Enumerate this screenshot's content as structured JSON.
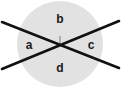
{
  "figure": {
    "background_color": "#ffffff",
    "circle": {
      "name": "shaded-circle",
      "fill_color": "#e2e2e2",
      "center_x": 60,
      "center_y": 44,
      "radius": 43
    },
    "lines": [
      {
        "name": "line-ascending",
        "color": "#111111",
        "width": 2.6,
        "x1": 2,
        "y1": 69,
        "x2": 119,
        "y2": 21
      },
      {
        "name": "line-descending",
        "color": "#111111",
        "width": 2.6,
        "x1": 2,
        "y1": 22,
        "x2": 119,
        "y2": 68
      }
    ],
    "tick_mark": {
      "name": "center-tick",
      "color": "#6e6e6e",
      "x1": 60,
      "y1": 36,
      "x2": 60,
      "y2": 43
    },
    "labels": [
      {
        "name": "angle-label-b",
        "text": "b",
        "x": 60,
        "y": 20
      },
      {
        "name": "angle-label-a",
        "text": "a",
        "x": 29,
        "y": 46
      },
      {
        "name": "angle-label-c",
        "text": "c",
        "x": 91,
        "y": 46
      },
      {
        "name": "angle-label-d",
        "text": "d",
        "x": 60,
        "y": 69
      }
    ]
  }
}
